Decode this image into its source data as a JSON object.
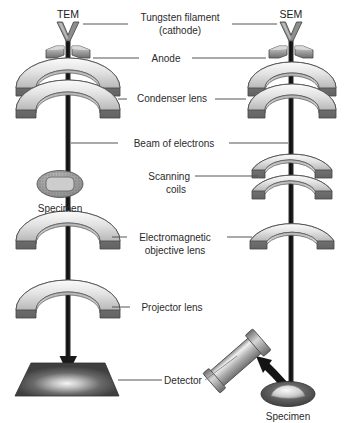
{
  "diagram": {
    "title_left": "TEM",
    "title_right": "SEM",
    "background_color": "#ffffff",
    "text_color": "#2b2b2b",
    "leader_color": "#555555"
  },
  "column_headers": [
    {
      "id": "tem",
      "label": "TEM",
      "x": 68,
      "y": 14
    },
    {
      "id": "sem",
      "label": "SEM",
      "x": 291,
      "y": 14
    }
  ],
  "center_labels": [
    {
      "id": "tungsten-filament",
      "line1": "Tungsten filament",
      "line2": "(cathode)",
      "y": 20,
      "has_left_leader": true,
      "has_right_leader": true
    },
    {
      "id": "anode",
      "line1": "Anode",
      "line2": "",
      "y": 58,
      "has_left_leader": true,
      "has_right_leader": true
    },
    {
      "id": "condenser-lens",
      "line1": "Condenser lens",
      "line2": "",
      "y": 99,
      "has_left_leader": true,
      "has_right_leader": true
    },
    {
      "id": "beam-of-electrons",
      "line1": "Beam of electrons",
      "line2": "",
      "y": 143,
      "has_left_leader": true,
      "has_right_leader": true
    },
    {
      "id": "scanning-coils",
      "line1": "Scanning",
      "line2": "coils",
      "y": 176,
      "has_left_leader": false,
      "has_right_leader": true
    },
    {
      "id": "electromagnetic-objective-lens",
      "line1": "Electromagnetic",
      "line2": "objective lens",
      "y": 237,
      "has_left_leader": true,
      "has_right_leader": true
    },
    {
      "id": "projector-lens",
      "line1": "Projector lens",
      "line2": "",
      "y": 307,
      "has_left_leader": true,
      "has_right_leader": false
    },
    {
      "id": "detector",
      "line1": "Detector",
      "line2": "",
      "y": 380,
      "has_left_leader": true,
      "has_right_leader": true
    }
  ],
  "inline_labels": [
    {
      "id": "tem-specimen",
      "label": "Specimen",
      "x": 60,
      "y": 208,
      "anchor": "middle"
    },
    {
      "id": "sem-specimen",
      "label": "Specimen",
      "x": 288,
      "y": 417,
      "anchor": "middle"
    }
  ],
  "components": {
    "tem": {
      "column_x": 68,
      "filament": {
        "label": "tungsten-filament-v",
        "cx": 68,
        "top_y": 22,
        "bottom_y": 40,
        "half_width": 11
      },
      "anode": {
        "label": "anode-blocks",
        "cy": 52,
        "half_span": 22
      },
      "condenser_lens": {
        "label": "condenser-lens",
        "cy": 95,
        "tiers": 2,
        "radius": 48
      },
      "specimen": {
        "label": "specimen-disc",
        "cx": 60,
        "cy": 184,
        "rx": 22,
        "ry": 13
      },
      "objective_lens": {
        "label": "objective-lens",
        "cy": 243,
        "tiers": 1,
        "radius": 48
      },
      "projector_lens": {
        "label": "projector-lens",
        "cy": 310,
        "tiers": 1,
        "radius": 48
      },
      "detector_screen": {
        "label": "detector-screen",
        "cy": 379,
        "top_width": 74,
        "bottom_width": 104
      }
    },
    "sem": {
      "column_x": 291,
      "filament": {
        "label": "tungsten-filament-v",
        "cx": 291,
        "top_y": 22,
        "bottom_y": 40,
        "half_width": 11
      },
      "anode": {
        "label": "anode-blocks",
        "cy": 52,
        "half_span": 22
      },
      "condenser_lens": {
        "label": "condenser-lens",
        "cy": 95,
        "tiers": 2,
        "radius": 41
      },
      "scanning_coils": {
        "label": "scanning-coils",
        "cy": 178,
        "tiers": 2,
        "radius": 41
      },
      "objective_lens": {
        "label": "objective-lens",
        "cy": 237,
        "tiers": 1,
        "radius": 41
      },
      "detector_tube": {
        "label": "detector-tube",
        "angle_deg": -42,
        "length": 62
      },
      "specimen_stage": {
        "label": "specimen-stage",
        "cx": 288,
        "cy": 394,
        "rx": 26,
        "ry": 12
      }
    }
  },
  "colors": {
    "column": "#1a1a1a",
    "lens_top_light": "#f2f2f2",
    "lens_top_mid": "#c9c9c9",
    "lens_face_dark": "#6e6e6e",
    "lens_face_mid": "#8f8f8f",
    "lens_outline": "#4a4a4a",
    "screen_dark": "#3d3d3d",
    "screen_glow": "#efefef",
    "specimen_fill": "#9a9a9a",
    "specimen_inner": "#c4c4c4",
    "tube_body": "#b0b0b0"
  }
}
